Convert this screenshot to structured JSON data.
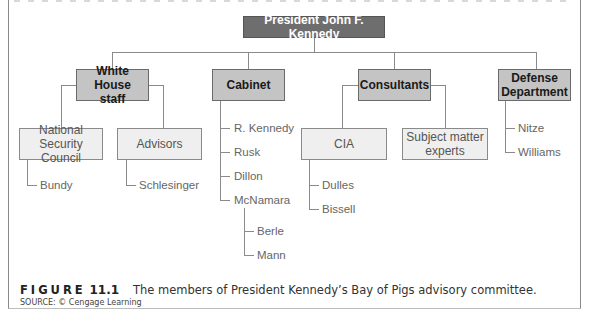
{
  "diagram": {
    "root": {
      "label": "President John F. Kennedy"
    },
    "branches": [
      {
        "label": "White House staff",
        "children": [
          {
            "label": "National Security Council",
            "members": [
              "Bundy"
            ]
          },
          {
            "label": "Advisors",
            "members": [
              "Schlesinger"
            ]
          }
        ]
      },
      {
        "label": "Cabinet",
        "members": [
          "R. Kennedy",
          "Rusk",
          "Dillon",
          "McNamara"
        ],
        "sub_members": {
          "McNamara": [
            "Berle",
            "Mann"
          ]
        }
      },
      {
        "label": "Consultants",
        "children": [
          {
            "label": "CIA",
            "members": [
              "Dulles",
              "Bissell"
            ]
          },
          {
            "label": "Subject matter experts",
            "members": []
          }
        ]
      },
      {
        "label": "Defense Department",
        "members": [
          "Nitze",
          "Williams"
        ]
      }
    ],
    "labels": {
      "whs_line1": "White House",
      "whs_line2": "staff",
      "defense_line1": "Defense",
      "defense_line2": "Department",
      "nsc_line1": "National Security",
      "nsc_line2": "Council",
      "sme_line1": "Subject matter",
      "sme_line2": "experts"
    }
  },
  "caption": {
    "figure_label": "FIGURE",
    "figure_number": "11.1",
    "text": "The members of President Kennedy’s Bay of Pigs advisory committee.",
    "source": "SOURCE: © Cengage Learning"
  }
}
